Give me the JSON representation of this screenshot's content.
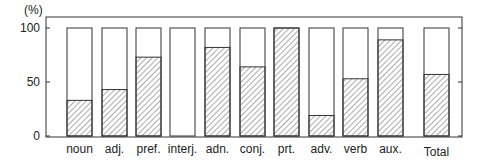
{
  "chart_data": {
    "type": "bar",
    "stacked": true,
    "title": "",
    "xlabel": "",
    "ylabel": "(%)",
    "ylim": [
      0,
      100
    ],
    "yticks": [
      0,
      50,
      100
    ],
    "grid": false,
    "legend": null,
    "categories": [
      "noun",
      "adj.",
      "pref.",
      "interj.",
      "adn.",
      "conj.",
      "prt.",
      "adv.",
      "verb",
      "aux.",
      "Total"
    ],
    "series": [
      {
        "name": "hatched",
        "pattern": "diagonal-hatch",
        "values": [
          33,
          43,
          73,
          0,
          82,
          64,
          100,
          19,
          53,
          89,
          57
        ]
      },
      {
        "name": "blank",
        "pattern": "none",
        "values": [
          67,
          57,
          27,
          100,
          18,
          36,
          0,
          81,
          47,
          11,
          43
        ]
      }
    ]
  },
  "colors": {
    "stroke": "#333333",
    "hatch": "#555555",
    "background": "#ffffff"
  }
}
